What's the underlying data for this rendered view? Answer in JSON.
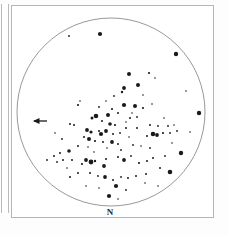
{
  "figure": {
    "kind": "star-chart",
    "background_color": "#ffffff",
    "frame_color": "#b5b5b5",
    "ink_color": "#1a1a1a",
    "width": 229,
    "height": 235
  },
  "labels": {
    "north": "N",
    "east_arrow": "arrow-left-icon"
  },
  "chart_data": {
    "type": "scatter",
    "title": "",
    "subtitle": "",
    "xlabel": "",
    "ylabel": "",
    "legend_position": "none",
    "grid": false,
    "annotations": [
      {
        "text": "N",
        "x": 110,
        "y": 214,
        "meaning": "north-direction-label"
      },
      {
        "text": "",
        "x": 40,
        "y": 121,
        "meaning": "east-direction-arrow-pointing-left"
      }
    ],
    "field_of_view": {
      "shape": "circle",
      "center_x": 111,
      "center_y": 112,
      "radius": 94,
      "stroke": "#7d7d7d",
      "stroke_width": 0.8
    },
    "xlim": [
      17,
      205
    ],
    "ylim": [
      18,
      206
    ],
    "point_size_key": "r = apparent magnitude marker radius in px (larger = brighter)",
    "series": [
      {
        "name": "cluster stars",
        "marker": "filled-circle",
        "color": "#1a1a1a",
        "points": [
          {
            "x": 69,
            "y": 36,
            "r": 0.9
          },
          {
            "x": 100,
            "y": 34,
            "r": 2.1
          },
          {
            "x": 176,
            "y": 54,
            "r": 2.2
          },
          {
            "x": 149,
            "y": 73,
            "r": 1.1
          },
          {
            "x": 129,
            "y": 74,
            "r": 2.0
          },
          {
            "x": 155,
            "y": 78,
            "r": 0.8
          },
          {
            "x": 138,
            "y": 85,
            "r": 2.0
          },
          {
            "x": 124,
            "y": 88,
            "r": 1.9
          },
          {
            "x": 122,
            "y": 92,
            "r": 1.2
          },
          {
            "x": 186,
            "y": 91,
            "r": 0.8
          },
          {
            "x": 78,
            "y": 105,
            "r": 1.1
          },
          {
            "x": 199,
            "y": 113,
            "r": 2.2
          },
          {
            "x": 124,
            "y": 105,
            "r": 2.1
          },
          {
            "x": 135,
            "y": 106,
            "r": 2.0
          },
          {
            "x": 143,
            "y": 108,
            "r": 1.1
          },
          {
            "x": 112,
            "y": 109,
            "r": 1.1
          },
          {
            "x": 118,
            "y": 113,
            "r": 1.0
          },
          {
            "x": 96,
            "y": 116,
            "r": 2.3
          },
          {
            "x": 92,
            "y": 118,
            "r": 1.5
          },
          {
            "x": 108,
            "y": 115,
            "r": 2.0
          },
          {
            "x": 102,
            "y": 121,
            "r": 1.0
          },
          {
            "x": 130,
            "y": 118,
            "r": 1.0
          },
          {
            "x": 126,
            "y": 122,
            "r": 0.8
          },
          {
            "x": 110,
            "y": 124,
            "r": 1.8
          },
          {
            "x": 115,
            "y": 125,
            "r": 1.1
          },
          {
            "x": 70,
            "y": 124,
            "r": 1.0
          },
          {
            "x": 74,
            "y": 125,
            "r": 1.0
          },
          {
            "x": 87,
            "y": 130,
            "r": 1.9
          },
          {
            "x": 91,
            "y": 132,
            "r": 1.6
          },
          {
            "x": 99,
            "y": 131,
            "r": 1.0
          },
          {
            "x": 106,
            "y": 131,
            "r": 1.9
          },
          {
            "x": 101,
            "y": 134,
            "r": 2.1
          },
          {
            "x": 113,
            "y": 134,
            "r": 1.0
          },
          {
            "x": 120,
            "y": 133,
            "r": 0.9
          },
          {
            "x": 126,
            "y": 128,
            "r": 1.0
          },
          {
            "x": 129,
            "y": 137,
            "r": 0.8
          },
          {
            "x": 137,
            "y": 128,
            "r": 1.0
          },
          {
            "x": 150,
            "y": 125,
            "r": 1.0
          },
          {
            "x": 158,
            "y": 126,
            "r": 0.9
          },
          {
            "x": 168,
            "y": 126,
            "r": 0.9
          },
          {
            "x": 174,
            "y": 125,
            "r": 0.8
          },
          {
            "x": 153,
            "y": 134,
            "r": 2.3
          },
          {
            "x": 157,
            "y": 135,
            "r": 1.9
          },
          {
            "x": 163,
            "y": 133,
            "r": 1.1
          },
          {
            "x": 170,
            "y": 133,
            "r": 0.9
          },
          {
            "x": 147,
            "y": 136,
            "r": 1.0
          },
          {
            "x": 84,
            "y": 137,
            "r": 1.0
          },
          {
            "x": 89,
            "y": 139,
            "r": 2.0
          },
          {
            "x": 95,
            "y": 141,
            "r": 1.1
          },
          {
            "x": 103,
            "y": 142,
            "r": 1.0
          },
          {
            "x": 112,
            "y": 142,
            "r": 1.9
          },
          {
            "x": 118,
            "y": 144,
            "r": 1.0
          },
          {
            "x": 78,
            "y": 146,
            "r": 1.0
          },
          {
            "x": 69,
            "y": 151,
            "r": 1.8
          },
          {
            "x": 60,
            "y": 153,
            "r": 1.0
          },
          {
            "x": 54,
            "y": 156,
            "r": 1.0
          },
          {
            "x": 63,
            "y": 160,
            "r": 1.0
          },
          {
            "x": 57,
            "y": 162,
            "r": 0.9
          },
          {
            "x": 72,
            "y": 160,
            "r": 1.0
          },
          {
            "x": 86,
            "y": 160,
            "r": 1.9
          },
          {
            "x": 91,
            "y": 162,
            "r": 2.4
          },
          {
            "x": 95,
            "y": 161,
            "r": 1.2
          },
          {
            "x": 82,
            "y": 164,
            "r": 1.1
          },
          {
            "x": 106,
            "y": 159,
            "r": 1.0
          },
          {
            "x": 104,
            "y": 166,
            "r": 1.9
          },
          {
            "x": 118,
            "y": 157,
            "r": 1.0
          },
          {
            "x": 124,
            "y": 160,
            "r": 1.9
          },
          {
            "x": 131,
            "y": 156,
            "r": 0.9
          },
          {
            "x": 139,
            "y": 163,
            "r": 1.1
          },
          {
            "x": 147,
            "y": 161,
            "r": 1.0
          },
          {
            "x": 153,
            "y": 158,
            "r": 1.0
          },
          {
            "x": 165,
            "y": 156,
            "r": 0.9
          },
          {
            "x": 181,
            "y": 153,
            "r": 2.2
          },
          {
            "x": 160,
            "y": 168,
            "r": 1.0
          },
          {
            "x": 170,
            "y": 172,
            "r": 2.3
          },
          {
            "x": 146,
            "y": 174,
            "r": 1.0
          },
          {
            "x": 136,
            "y": 176,
            "r": 1.0
          },
          {
            "x": 128,
            "y": 178,
            "r": 1.0
          },
          {
            "x": 121,
            "y": 177,
            "r": 0.9
          },
          {
            "x": 113,
            "y": 180,
            "r": 1.0
          },
          {
            "x": 105,
            "y": 177,
            "r": 1.9
          },
          {
            "x": 98,
            "y": 176,
            "r": 0.9
          },
          {
            "x": 90,
            "y": 173,
            "r": 1.0
          },
          {
            "x": 78,
            "y": 173,
            "r": 1.0
          },
          {
            "x": 70,
            "y": 177,
            "r": 1.0
          },
          {
            "x": 116,
            "y": 186,
            "r": 2.1
          },
          {
            "x": 126,
            "y": 190,
            "r": 0.9
          },
          {
            "x": 109,
            "y": 196,
            "r": 2.1
          },
          {
            "x": 118,
            "y": 199,
            "r": 0.8
          },
          {
            "x": 133,
            "y": 145,
            "r": 0.9
          },
          {
            "x": 141,
            "y": 146,
            "r": 0.8
          },
          {
            "x": 62,
            "y": 139,
            "r": 0.9
          },
          {
            "x": 80,
            "y": 101,
            "r": 0.8
          },
          {
            "x": 114,
            "y": 96,
            "r": 0.9
          },
          {
            "x": 143,
            "y": 95,
            "r": 0.8
          },
          {
            "x": 132,
            "y": 113,
            "r": 0.8
          },
          {
            "x": 99,
            "y": 107,
            "r": 0.9
          },
          {
            "x": 88,
            "y": 147,
            "r": 0.8
          },
          {
            "x": 150,
            "y": 148,
            "r": 0.9
          },
          {
            "x": 172,
            "y": 143,
            "r": 0.8
          },
          {
            "x": 164,
            "y": 118,
            "r": 0.8
          },
          {
            "x": 145,
            "y": 183,
            "r": 0.8
          },
          {
            "x": 99,
            "y": 188,
            "r": 0.8
          },
          {
            "x": 67,
            "y": 168,
            "r": 0.8
          },
          {
            "x": 47,
            "y": 160,
            "r": 0.9
          },
          {
            "x": 107,
            "y": 148,
            "r": 0.8
          },
          {
            "x": 121,
            "y": 150,
            "r": 0.9
          },
          {
            "x": 94,
            "y": 152,
            "r": 0.8
          },
          {
            "x": 137,
            "y": 117,
            "r": 0.9
          },
          {
            "x": 106,
            "y": 101,
            "r": 0.8
          },
          {
            "x": 152,
            "y": 104,
            "r": 0.8
          },
          {
            "x": 190,
            "y": 132,
            "r": 0.8
          },
          {
            "x": 55,
            "y": 133,
            "r": 0.8
          },
          {
            "x": 177,
            "y": 131,
            "r": 0.9
          },
          {
            "x": 158,
            "y": 186,
            "r": 0.8
          },
          {
            "x": 86,
            "y": 186,
            "r": 0.8
          }
        ]
      }
    ]
  }
}
